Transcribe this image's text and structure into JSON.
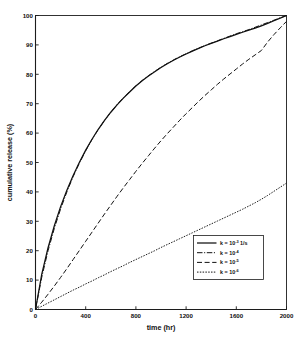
{
  "chart_data": {
    "type": "line",
    "title": "",
    "xlabel": "time (hr)",
    "ylabel": "cumulative release (%)",
    "xlim": [
      0,
      2000
    ],
    "ylim": [
      0,
      100
    ],
    "xticks": [
      0,
      400,
      800,
      1200,
      1600,
      2000
    ],
    "yticks": [
      0,
      10,
      20,
      30,
      40,
      50,
      60,
      70,
      80,
      90,
      100
    ],
    "xticklabels": [
      "0",
      "400",
      "800",
      "1200",
      "1600",
      "2000"
    ],
    "yticklabels": [
      "0",
      "10",
      "20",
      "30",
      "40",
      "50",
      "60",
      "70",
      "80",
      "90",
      "100"
    ],
    "grid": false,
    "legend_position": "lower right",
    "x": [
      0,
      50,
      100,
      150,
      200,
      250,
      300,
      350,
      400,
      450,
      500,
      550,
      600,
      650,
      700,
      750,
      800,
      850,
      900,
      950,
      1000,
      1050,
      1100,
      1150,
      1200,
      1250,
      1300,
      1350,
      1400,
      1450,
      1500,
      1550,
      1600,
      1650,
      1700,
      1750,
      1800,
      1850,
      1900,
      1950,
      2000
    ],
    "series": [
      {
        "name": "k = 10-3 1/s",
        "label_prefix": "k  =  10",
        "label_exponent": "-3",
        "label_units": "1/s",
        "linestyle": "solid",
        "color": "#111111",
        "values": [
          0,
          12.0,
          21.0,
          28.5,
          35.0,
          40.6,
          45.6,
          50.1,
          54.2,
          57.9,
          61.3,
          64.3,
          67.1,
          69.6,
          71.9,
          74.0,
          76.0,
          77.8,
          79.4,
          80.9,
          82.3,
          83.6,
          84.8,
          85.9,
          86.9,
          87.9,
          88.8,
          89.7,
          90.5,
          91.3,
          92.1,
          92.8,
          93.6,
          94.3,
          95.0,
          95.7,
          96.5,
          97.3,
          98.2,
          99.1,
          100.0
        ]
      },
      {
        "name": "k = 10-4",
        "label_prefix": "k  =  10",
        "label_exponent": "-4",
        "label_units": "",
        "linestyle": "dashdot",
        "color": "#111111",
        "values": [
          0,
          11.0,
          20.0,
          27.6,
          34.2,
          40.0,
          45.2,
          49.8,
          54.0,
          57.8,
          61.2,
          64.3,
          67.1,
          69.7,
          72.0,
          74.1,
          76.1,
          77.9,
          79.5,
          81.0,
          82.4,
          83.7,
          84.9,
          86.0,
          87.0,
          88.0,
          88.9,
          89.8,
          90.6,
          91.4,
          92.2,
          93.0,
          93.8,
          94.5,
          95.2,
          96.0,
          96.8,
          97.6,
          98.4,
          99.2,
          100.0
        ]
      },
      {
        "name": "k = 10-5",
        "label_prefix": "k  =  10",
        "label_exponent": "-5",
        "label_units": "",
        "linestyle": "dashed",
        "color": "#111111",
        "values": [
          0,
          2.5,
          5.2,
          8.0,
          10.9,
          13.9,
          17.0,
          20.1,
          23.2,
          26.3,
          29.4,
          32.5,
          35.5,
          38.5,
          41.4,
          44.2,
          47.0,
          49.7,
          52.3,
          54.9,
          57.4,
          59.8,
          62.1,
          64.4,
          66.6,
          68.7,
          70.8,
          72.8,
          74.7,
          76.6,
          78.4,
          80.1,
          81.8,
          83.5,
          85.1,
          86.6,
          88.1,
          91.0,
          93.5,
          95.8,
          98.0
        ]
      },
      {
        "name": "k = 10-6",
        "label_prefix": "k  =  10",
        "label_exponent": "-6",
        "label_units": "",
        "linestyle": "dotted",
        "color": "#111111",
        "values": [
          0,
          1.1,
          2.2,
          3.3,
          4.4,
          5.5,
          6.6,
          7.6,
          8.7,
          9.7,
          10.8,
          11.8,
          12.9,
          13.9,
          14.9,
          16.0,
          17.0,
          18.0,
          19.0,
          20.0,
          21.1,
          22.1,
          23.1,
          24.1,
          25.1,
          26.1,
          27.1,
          28.1,
          29.1,
          30.1,
          31.1,
          32.1,
          33.1,
          34.1,
          35.2,
          36.3,
          37.5,
          38.8,
          40.2,
          41.6,
          43.0
        ]
      }
    ],
    "legend": {
      "entries": [
        {
          "prefix": "k  =  10",
          "exponent": "-3",
          "units": "1/s",
          "linestyle": "solid"
        },
        {
          "prefix": "k  =  10",
          "exponent": "-4",
          "units": "",
          "linestyle": "dashdot"
        },
        {
          "prefix": "k  =  10",
          "exponent": "-5",
          "units": "",
          "linestyle": "dashed"
        },
        {
          "prefix": "k  =  10",
          "exponent": "-6",
          "units": "",
          "linestyle": "dotted"
        }
      ]
    }
  }
}
